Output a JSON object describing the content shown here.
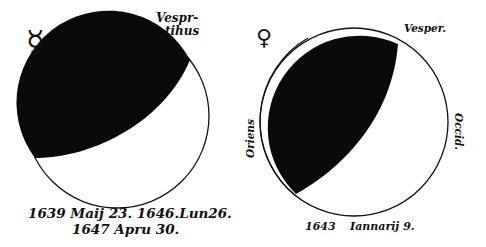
{
  "left_figure": {
    "planet_symbol": "☿",
    "planet_icon": "mercury-symbol-icon",
    "label_top": [
      "Vespr-",
      "tihus"
    ],
    "caption_line1": "1639 Maij 23.  1646.Lun26.",
    "caption_line2": "1647 Apru 30."
  },
  "right_figure": {
    "planet_symbol": "♀",
    "planet_icon": "venus-symbol-icon",
    "label_top": "Vesper.",
    "label_left": "Oriens",
    "label_right": "Occid.",
    "caption_year": "1643",
    "caption_date": "Iannarij  9."
  },
  "colors": {
    "ink": "#0a0a0a",
    "paper": "#ffffff"
  }
}
